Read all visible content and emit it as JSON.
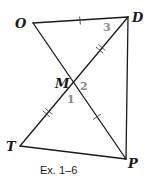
{
  "figure": {
    "caption": "Ex. 1–6",
    "points": {
      "O": {
        "label": "O",
        "x": 33,
        "y": 23
      },
      "D": {
        "label": "D",
        "x": 128,
        "y": 17
      },
      "M": {
        "label": "M",
        "x": 73,
        "y": 83
      },
      "T": {
        "label": "T",
        "x": 20,
        "y": 146
      },
      "P": {
        "label": "P",
        "x": 126,
        "y": 159
      }
    },
    "segments": [
      "OD",
      "OP",
      "TD",
      "DP",
      "TP"
    ],
    "angles": [
      {
        "label": "1",
        "vertex": "M"
      },
      {
        "label": "2",
        "vertex": "M"
      },
      {
        "label": "3",
        "vertex": "D"
      }
    ],
    "congruence_marks": [
      {
        "segment": "OD",
        "ticks": 1
      },
      {
        "segment": "MP",
        "ticks": 1
      },
      {
        "segment": "MD",
        "ticks": 2
      },
      {
        "segment": "TM",
        "ticks": 2
      }
    ],
    "colors": {
      "line": "#1a1a1a",
      "angle_label": "#8a8a8a"
    }
  }
}
